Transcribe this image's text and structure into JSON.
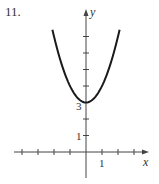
{
  "problem": {
    "number": "11."
  },
  "chart_data": {
    "type": "line",
    "title": "",
    "xlabel": "x",
    "ylabel": "y",
    "function": "y = x^2 + 3",
    "series": [
      {
        "name": "parabola",
        "x": [
          -2.1,
          -1.5,
          -1,
          -0.5,
          0,
          0.5,
          1,
          1.5,
          2.1
        ],
        "y": [
          7.41,
          5.25,
          4,
          3.25,
          3,
          3.25,
          4,
          5.25,
          7.41
        ]
      }
    ],
    "vertex": [
      0,
      3
    ],
    "x_ticks": [
      -4,
      -3,
      -2,
      -1,
      1,
      2,
      3
    ],
    "y_ticks": [
      1,
      2,
      3,
      4,
      5,
      6,
      7
    ],
    "tick_labels": {
      "x": [
        "1"
      ],
      "y": [
        "1",
        "3"
      ]
    },
    "xlim": [
      -4.5,
      3.8
    ],
    "ylim": [
      -1.6,
      8.6
    ],
    "grid": false,
    "color": "#1a1a1a"
  }
}
